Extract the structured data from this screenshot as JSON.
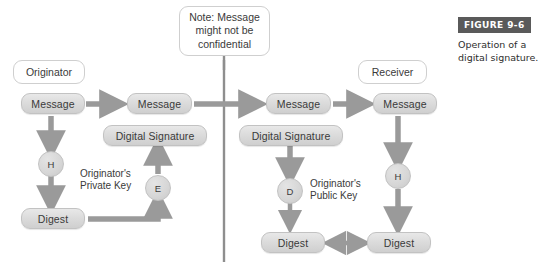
{
  "figure": {
    "badge": "FIGURE 9-6",
    "caption": "Operation of a digital signature."
  },
  "labels": {
    "originator": "Originator",
    "receiver": "Receiver",
    "note": "Note: Message might not be confidential"
  },
  "nodes": {
    "message_1": "Message",
    "message_2": "Message",
    "message_3": "Message",
    "message_4": "Message",
    "digital_signature_left": "Digital Signature",
    "digital_signature_right": "Digital Signature",
    "digest_left": "Digest",
    "digest_center": "Digest",
    "digest_right": "Digest",
    "hash_left": "H",
    "hash_right": "H",
    "encrypt": "E",
    "decrypt": "D"
  },
  "annotations": {
    "private_key": "Originator's\nPrivate Key",
    "public_key": "Originator's\nPublic Key"
  },
  "colors": {
    "pill_fill": "#dcdcdc",
    "pill_border": "#c2c2c2",
    "arrow": "#9a9a9a",
    "divider": "#8e8e8e",
    "badge_bg": "#5a5a5a",
    "text": "#3a3a3a"
  }
}
